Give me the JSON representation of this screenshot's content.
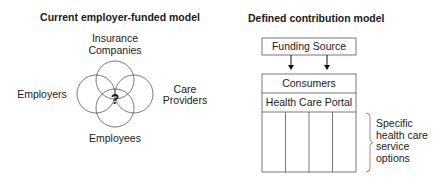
{
  "left_model": {
    "title": "Current employer-funded model",
    "center_label": "?",
    "parties": {
      "top": [
        "Insurance",
        "Companies"
      ],
      "left": "Employers",
      "right": [
        "Care",
        "Providers"
      ],
      "bottom": "Employees"
    }
  },
  "right_model": {
    "title": "Defined contribution model",
    "funding_source": "Funding Source",
    "consumers": "Consumers",
    "portal": "Health Care Portal",
    "option_columns": 4,
    "brace_label": [
      "Specific",
      "health care",
      "service",
      "options"
    ]
  }
}
